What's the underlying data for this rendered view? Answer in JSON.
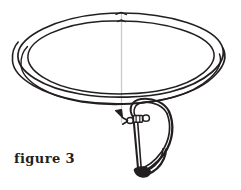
{
  "figure": {
    "caption": "figure 3",
    "title": "figure 3",
    "type": "line-art-diagram",
    "background_color": "#ffffff",
    "ink_color": "#231f20",
    "guide_line_color": "#c9c9c9",
    "canvas": {
      "width": 241,
      "height": 190
    }
  },
  "parts": [
    {
      "id": "upper-ring-outer",
      "label": "upper ring outer edge",
      "stroke": "#231f20",
      "stroke_width": 1.6
    },
    {
      "id": "upper-ring-inner",
      "label": "upper ring inner edge",
      "stroke": "#231f20",
      "stroke_width": 1.6
    },
    {
      "id": "lower-coil-outer",
      "label": "lower coil outer edge",
      "stroke": "#231f20",
      "stroke_width": 1.6
    },
    {
      "id": "lower-coil-inner",
      "label": "lower coil inner edge",
      "stroke": "#231f20",
      "stroke_width": 1.6
    },
    {
      "id": "center-guide-line",
      "label": "vertical guide line",
      "stroke": "#c9c9c9",
      "stroke_width": 1.2
    },
    {
      "id": "hook-shank",
      "label": "hook shank",
      "stroke": "#231f20",
      "stroke_width": 2.0
    },
    {
      "id": "hook-bend",
      "label": "hook bend and point",
      "stroke": "#231f20",
      "stroke_width": 2.2
    },
    {
      "id": "hook-barb",
      "label": "hook barb",
      "stroke": "#231f20",
      "stroke_width": 2.0
    },
    {
      "id": "swivel-barrel",
      "label": "swivel barrel",
      "stroke": "#231f20",
      "stroke_width": 1.4
    },
    {
      "id": "swivel-eye",
      "label": "swivel eye ring",
      "stroke": "#231f20",
      "stroke_width": 1.4
    },
    {
      "id": "arrow-head",
      "label": "attachment arrow head",
      "stroke": "#231f20",
      "stroke_width": 1.4
    }
  ]
}
